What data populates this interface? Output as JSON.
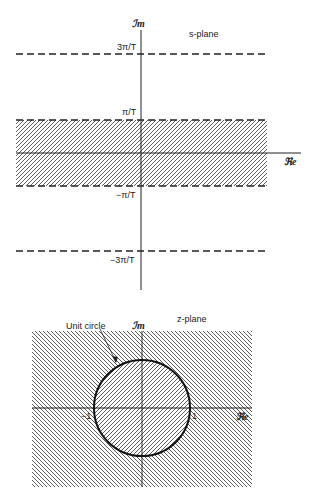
{
  "s_plane": {
    "title": "s-plane",
    "imag_axis_label": "ℐm",
    "real_axis_label": "ℜe",
    "ticks": {
      "pos3": "3π/T",
      "pos1": "π/T",
      "neg1": "−π/T",
      "neg3": "−3π/T"
    },
    "shaded_region": "strip between −π/T and π/T"
  },
  "z_plane": {
    "title": "z-plane",
    "imag_axis_label": "ℐm",
    "real_axis_label": "ℜe",
    "circle_label": "Unit circle",
    "ticks": {
      "neg1": "−1",
      "pos1": "1"
    }
  },
  "colors": {
    "ink": "#222222",
    "background": "#ffffff"
  }
}
